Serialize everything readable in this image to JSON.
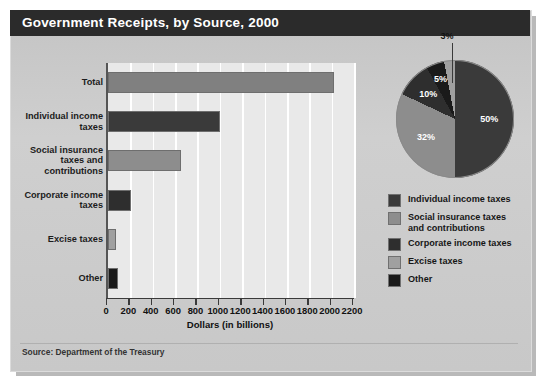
{
  "title": "Government Receipts, by Source, 2000",
  "source_text": "Source: Department of the Treasury",
  "axis": {
    "xtitle": "Dollars (in billions)",
    "ticks": [
      "0",
      "200",
      "400",
      "600",
      "800",
      "1000",
      "1200",
      "1400",
      "1600",
      "1800",
      "2000",
      "2200"
    ]
  },
  "legend": {
    "items": [
      {
        "label": "Individual income taxes",
        "color": "#3a3a3a"
      },
      {
        "label": "Social insurance taxes and contributions",
        "color": "#8d8d8d"
      },
      {
        "label": "Corporate income taxes",
        "color": "#2e2e2e"
      },
      {
        "label": "Excise taxes",
        "color": "#a0a0a0"
      },
      {
        "label": "Other",
        "color": "#1a1a1a"
      }
    ]
  },
  "pie_labels": [
    "50%",
    "32%",
    "10%",
    "5%",
    "3%"
  ],
  "chart_data": {
    "type": "bar",
    "title": "Government Receipts, by Source, 2000",
    "xlabel": "Dollars (in billions)",
    "ylabel": "",
    "xlim": [
      0,
      2200
    ],
    "grid": true,
    "categories": [
      "Total",
      "Individual income taxes",
      "Social insurance taxes and contributions",
      "Corporate income taxes",
      "Excise taxes",
      "Other"
    ],
    "values": [
      2025,
      1004,
      653,
      207,
      69,
      92
    ],
    "bar_colors": [
      "#808080",
      "#3a3a3a",
      "#8d8d8d",
      "#2e2e2e",
      "#a0a0a0",
      "#1a1a1a"
    ],
    "pie": {
      "type": "pie",
      "labels": [
        "Individual income taxes",
        "Social insurance taxes and contributions",
        "Corporate income taxes",
        "Excise taxes",
        "Other"
      ],
      "values": [
        50,
        32,
        10,
        5,
        3
      ],
      "colors": [
        "#3a3a3a",
        "#8d8d8d",
        "#2e2e2e",
        "#1a1a1a",
        "#a0a0a0"
      ],
      "legend_position": "bottom"
    }
  }
}
